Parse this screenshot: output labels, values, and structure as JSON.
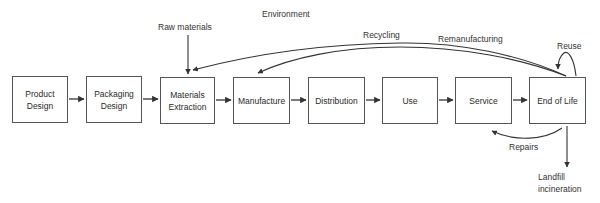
{
  "diagram": {
    "title": "Environment",
    "stages": [
      {
        "id": "product-design",
        "label": "Product\nDesign"
      },
      {
        "id": "packaging-design",
        "label": "Packaging\nDesign"
      },
      {
        "id": "materials-extraction",
        "label": "Materials\nExtraction"
      },
      {
        "id": "manufacture",
        "label": "Manufacture"
      },
      {
        "id": "distribution",
        "label": "Distribution"
      },
      {
        "id": "use",
        "label": "Use"
      },
      {
        "id": "service",
        "label": "Service"
      },
      {
        "id": "end-of-life",
        "label": "End of Life"
      }
    ],
    "flows": [
      {
        "from": "product-design",
        "to": "packaging-design"
      },
      {
        "from": "packaging-design",
        "to": "materials-extraction"
      },
      {
        "from": "materials-extraction",
        "to": "manufacture"
      },
      {
        "from": "manufacture",
        "to": "distribution"
      },
      {
        "from": "distribution",
        "to": "use"
      },
      {
        "from": "use",
        "to": "service"
      },
      {
        "from": "service",
        "to": "end-of-life"
      }
    ],
    "loops": {
      "raw_materials": "Raw materials",
      "recycling": "Recycling",
      "remanufacturing": "Remanufacturing",
      "reuse": "Reuse",
      "repairs": "Repairs",
      "landfill": "Landfill\nincineration"
    },
    "colors": {
      "line": "#333333",
      "box_border": "#555555",
      "text": "#2a2a2a"
    }
  }
}
